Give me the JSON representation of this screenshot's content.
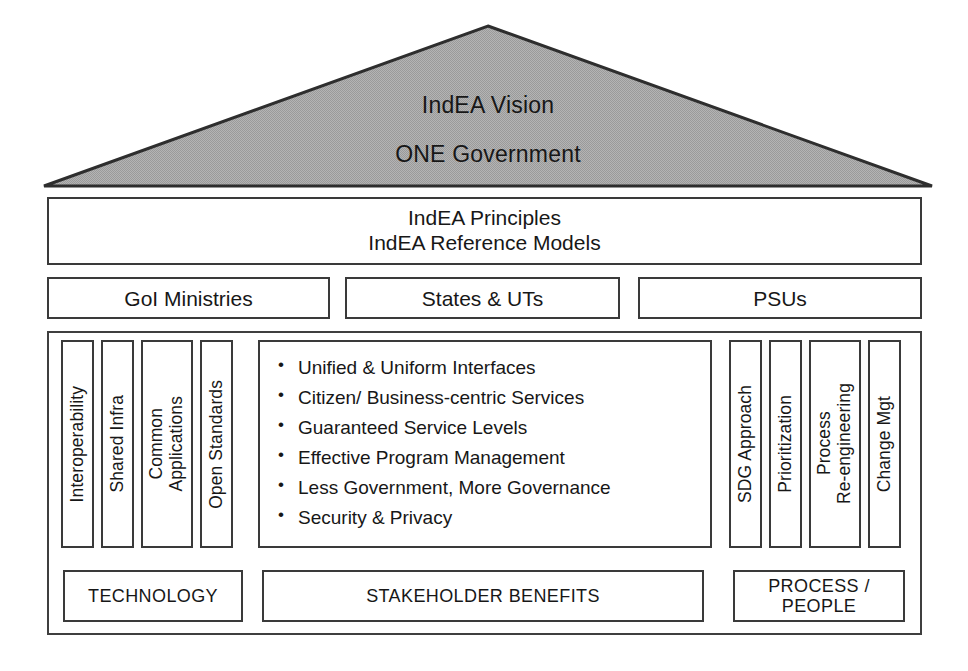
{
  "diagram": {
    "roof": {
      "name": "vision-roof",
      "fill_color": "#a9a9a9",
      "stroke_color": "#2e2e2e",
      "line1": "IndEA Vision",
      "line2": "ONE Government"
    },
    "principles_band": {
      "line1": "IndEA Principles",
      "line2": "IndEA Reference Models"
    },
    "org_row": [
      {
        "label": "GoI Ministries"
      },
      {
        "label": "States & UTs"
      },
      {
        "label": "PSUs"
      }
    ],
    "left_pillars": [
      {
        "label": "Interoperability"
      },
      {
        "label": "Shared Infra"
      },
      {
        "label": "Common\nApplications"
      },
      {
        "label": "Open Standards"
      }
    ],
    "right_pillars": [
      {
        "label": "SDG Approach"
      },
      {
        "label": "Prioritization"
      },
      {
        "label": "Process\nRe-engineering"
      },
      {
        "label": "Change Mgt"
      }
    ],
    "benefits": [
      "Unified & Uniform Interfaces",
      "Citizen/ Business-centric Services",
      "Guaranteed Service Levels",
      "Effective Program Management",
      "Less Government, More Governance",
      "Security & Privacy"
    ],
    "category_row": [
      {
        "label": "TECHNOLOGY"
      },
      {
        "label": "STAKEHOLDER BENEFITS"
      },
      {
        "label": "PROCESS /\nPEOPLE"
      }
    ]
  }
}
